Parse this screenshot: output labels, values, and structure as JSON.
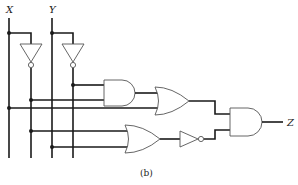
{
  "diagram": {
    "type": "logic-circuit",
    "inputs": [
      {
        "name": "X",
        "label": "X"
      },
      {
        "name": "Y",
        "label": "Y"
      }
    ],
    "output": {
      "name": "Z",
      "label": "Z"
    },
    "caption": "(b)",
    "gates": [
      {
        "id": "not1",
        "type": "NOT",
        "input": "X",
        "output": "X'"
      },
      {
        "id": "not2",
        "type": "NOT",
        "input": "Y",
        "output": "Y'"
      },
      {
        "id": "and1",
        "type": "AND",
        "inputs": [
          "Y'",
          "X'"
        ]
      },
      {
        "id": "or1",
        "type": "OR",
        "inputs": [
          "and1",
          "X"
        ]
      },
      {
        "id": "or2",
        "type": "OR",
        "inputs": [
          "X'",
          "Y"
        ]
      },
      {
        "id": "not3",
        "type": "NOT",
        "input": "or2"
      },
      {
        "id": "and2",
        "type": "AND",
        "inputs": [
          "or1",
          "not3"
        ],
        "output": "Z"
      }
    ],
    "colors": {
      "wire": "#1a1a1a",
      "gate_outline": "#555555",
      "background": "#ffffff"
    }
  }
}
